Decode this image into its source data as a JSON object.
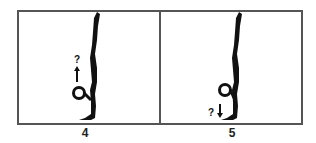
{
  "figure": {
    "panels": [
      {
        "label": "4",
        "annotation": "?",
        "arrow": "up"
      },
      {
        "label": "5",
        "annotation": "?",
        "arrow": "down"
      }
    ],
    "colors": {
      "ink": "#111111",
      "frame": "#555555",
      "background": "#ffffff"
    }
  }
}
